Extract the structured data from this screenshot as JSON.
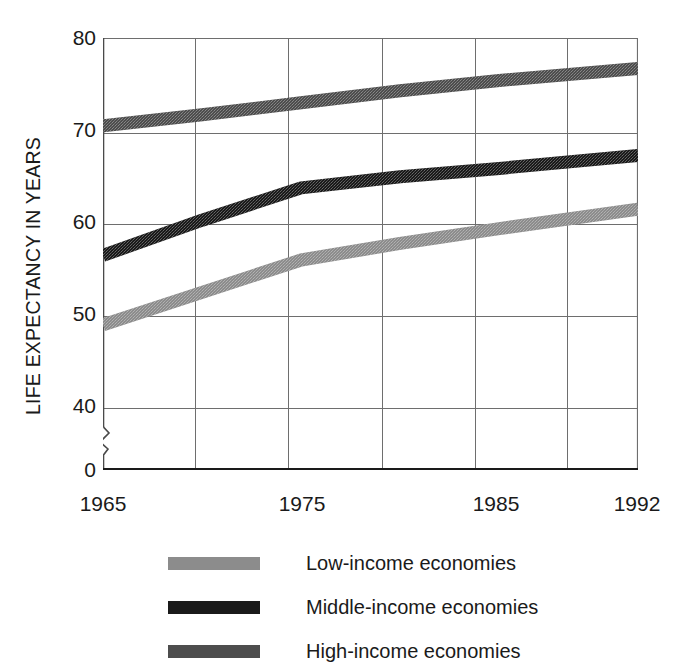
{
  "chart_data": {
    "type": "line",
    "title": "",
    "subtitle": "",
    "xlabel": "",
    "ylabel": "LIFE EXPECTANCY IN YEARS",
    "x": [
      1965,
      1970,
      1975,
      1980,
      1985,
      1992
    ],
    "xlim": [
      1965,
      1992
    ],
    "ylim": [
      38,
      80
    ],
    "y_axis_break": true,
    "y_axis_break_symbol": "zigzag",
    "grid": true,
    "grid_vertical_years": [
      1965,
      1970,
      1975,
      1980,
      1985,
      1990,
      1992
    ],
    "legend_position": "below",
    "y_ticks": [
      {
        "value": 80,
        "label": "80"
      },
      {
        "value": 70,
        "label": "70"
      },
      {
        "value": 60,
        "label": "60"
      },
      {
        "value": 50,
        "label": "50"
      },
      {
        "value": 40,
        "label": "40"
      },
      {
        "value": 0,
        "label": "0"
      }
    ],
    "x_ticks": [
      {
        "value": 1965,
        "label": "1965"
      },
      {
        "value": 1975,
        "label": "1975"
      },
      {
        "value": 1985,
        "label": "1985"
      },
      {
        "value": 1992,
        "label": "1992"
      }
    ],
    "series": [
      {
        "name": "Low-income economies",
        "color": "#8c8c8c",
        "values": [
          49.0,
          52.5,
          56.0,
          57.8,
          59.4,
          61.5
        ]
      },
      {
        "name": "Middle-income economies",
        "color": "#1a1a1a",
        "values": [
          56.5,
          60.3,
          63.8,
          65.0,
          65.9,
          67.3
        ]
      },
      {
        "name": "High-income economies",
        "color": "#4d4d4d",
        "values": [
          70.5,
          71.7,
          73.0,
          74.3,
          75.4,
          76.7
        ]
      }
    ]
  },
  "legend": {
    "items": [
      {
        "label": "Low-income economies",
        "color": "#8c8c8c"
      },
      {
        "label": "Middle-income economies",
        "color": "#1a1a1a"
      },
      {
        "label": "High-income economies",
        "color": "#4d4d4d"
      }
    ]
  },
  "axis": {
    "frame_color": "#6b6b6b",
    "baseline_color": "#1a1a1a"
  }
}
